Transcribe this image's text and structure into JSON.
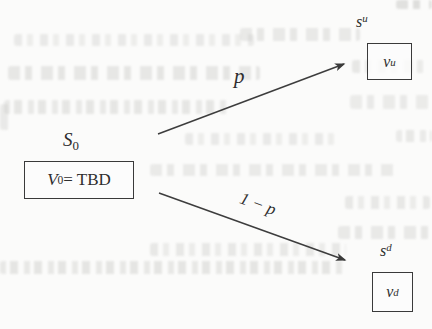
{
  "nodes": {
    "root": {
      "state": {
        "base": "S",
        "sub": "0"
      },
      "value": {
        "base": "V",
        "sub": "0",
        "suffix": " = TBD"
      }
    },
    "up": {
      "state": {
        "base": "s",
        "sup": "u"
      },
      "value": {
        "base": "v",
        "sup": "u"
      }
    },
    "down": {
      "state": {
        "base": "s",
        "sup": "d"
      },
      "value": {
        "base": "v",
        "sup": "d"
      }
    }
  },
  "edges": {
    "up": {
      "label": "p"
    },
    "down": {
      "label": "1 − p"
    }
  },
  "colors": {
    "ink": "#2e2e2e",
    "paper": "#fbfbfa",
    "bleedthrough": "#c8c8c5"
  }
}
